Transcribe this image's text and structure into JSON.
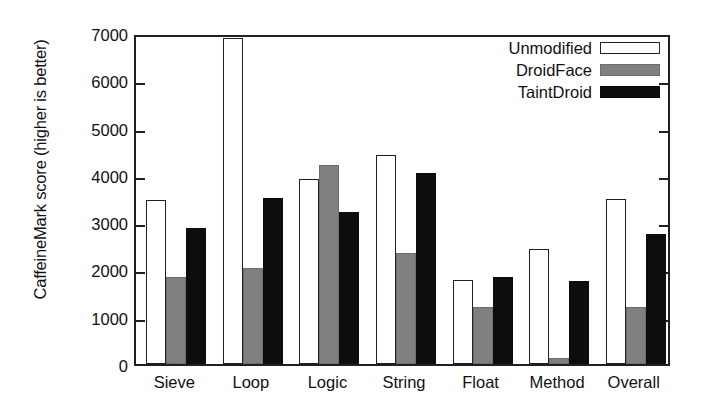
{
  "chart_data": {
    "type": "bar",
    "title": "",
    "xlabel": "",
    "ylabel": "CaffeineMark score (higher is better)",
    "categories": [
      "Sieve",
      "Loop",
      "Logic",
      "String",
      "Float",
      "Method",
      "Overall"
    ],
    "series": [
      {
        "name": "Unmodified",
        "color": "#ffffff",
        "values": [
          3470,
          6890,
          3920,
          4430,
          1780,
          2430,
          3490
        ]
      },
      {
        "name": "DroidFace",
        "color": "#808080",
        "values": [
          1830,
          2040,
          4200,
          2350,
          1200,
          130,
          1210
        ]
      },
      {
        "name": "TaintDroid",
        "color": "#0d0d0d",
        "values": [
          2880,
          3520,
          3210,
          4040,
          1850,
          1750,
          2740
        ]
      }
    ],
    "ylim": [
      0,
      7000
    ],
    "yticks": [
      0,
      1000,
      2000,
      3000,
      4000,
      5000,
      6000,
      7000
    ],
    "ytick_labels": [
      "0",
      "1000",
      "2000",
      "3000",
      "4000",
      "5000",
      "6000",
      "7000"
    ],
    "grid": false,
    "legend_position": "top-right",
    "legend_entries": [
      "Unmodified",
      "DroidFace",
      "TaintDroid"
    ]
  }
}
